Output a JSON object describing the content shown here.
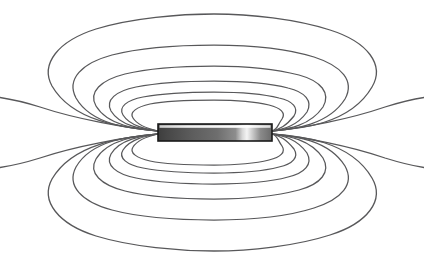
{
  "figure": {
    "kind": "magnetic-dipole-field-diagram",
    "canvas": {
      "width": 424,
      "height": 260,
      "background": "#ffffff"
    }
  },
  "colors": {
    "background": "#ffffff",
    "field_line": "#58585a",
    "magnet_outline": "#1a1a1a",
    "magnet_dark": "#3a3a3a",
    "magnet_mid": "#6e6e6e",
    "magnet_highlight": "#f2f2f2",
    "magnet_top_strip": "#e8e8e8"
  },
  "magnet": {
    "label": "bar-magnet",
    "x": 158,
    "y": 124,
    "width": 114,
    "height": 17,
    "left_pole_x": 158,
    "right_pole_x": 272,
    "center_y": 132.5
  },
  "chart_data": {
    "type": "line",
    "xlabel": "",
    "ylabel": "",
    "grid": false,
    "legend": null,
    "xlim": [
      0,
      424
    ],
    "ylim": [
      0,
      260
    ],
    "pole_left": [
      158,
      132.5
    ],
    "pole_right": [
      272,
      132.5
    ],
    "series": [
      {
        "name": "loop-top-1",
        "apex_y": 118,
        "half_width": 58,
        "closed": true
      },
      {
        "name": "loop-top-2",
        "apex_y": 108,
        "half_width": 74,
        "closed": true
      },
      {
        "name": "loop-top-3",
        "apex_y": 96,
        "half_width": 92,
        "closed": true
      },
      {
        "name": "loop-top-4",
        "apex_y": 78,
        "half_width": 112,
        "closed": true
      },
      {
        "name": "loop-top-5",
        "apex_y": 57,
        "half_width": 142,
        "closed": true
      },
      {
        "name": "loop-top-6",
        "apex_y": 24,
        "half_width": 172,
        "closed": true
      },
      {
        "name": "loop-bottom-1",
        "apex_y": 146,
        "half_width": 58,
        "closed": true
      },
      {
        "name": "loop-bottom-2",
        "apex_y": 156,
        "half_width": 74,
        "closed": true
      },
      {
        "name": "loop-bottom-3",
        "apex_y": 168,
        "half_width": 92,
        "closed": true
      },
      {
        "name": "loop-bottom-4",
        "apex_y": 186,
        "half_width": 112,
        "closed": true
      },
      {
        "name": "loop-bottom-5",
        "apex_y": 207,
        "half_width": 142,
        "closed": true
      },
      {
        "name": "loop-bottom-6",
        "apex_y": 240,
        "half_width": 172,
        "closed": true
      },
      {
        "name": "open-line-upper",
        "exit_left": [
          0,
          98
        ],
        "exit_right": [
          424,
          98
        ],
        "closed": false
      },
      {
        "name": "open-line-lower",
        "exit_left": [
          0,
          166
        ],
        "exit_right": [
          424,
          166
        ],
        "closed": false
      }
    ]
  }
}
